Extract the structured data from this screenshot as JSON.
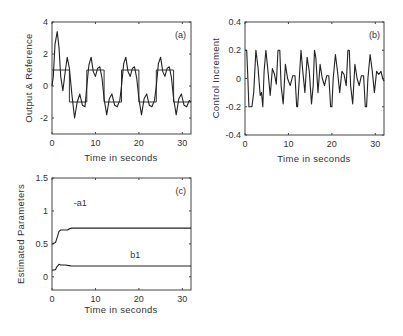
{
  "chart_data": [
    {
      "id": "a",
      "type": "line",
      "panel_label": "(a)",
      "xlabel": "Time in seconds",
      "ylabel": "Output & Reference",
      "xlim": [
        0,
        32
      ],
      "ylim": [
        -3,
        4
      ],
      "xticks": [
        0,
        10,
        20,
        30
      ],
      "yticks": [
        -2,
        0,
        2,
        4
      ],
      "series": [
        {
          "name": "Reference",
          "style": "step",
          "x": [
            0,
            4,
            4,
            8,
            8,
            12,
            12,
            16,
            16,
            20,
            20,
            24,
            24,
            28,
            28,
            32
          ],
          "y": [
            1,
            1,
            -1,
            -1,
            1,
            1,
            -1,
            -1,
            1,
            1,
            -1,
            -1,
            1,
            1,
            -1,
            -1
          ]
        },
        {
          "name": "Output",
          "x": [
            0,
            0.3,
            0.7,
            1.2,
            1.6,
            2.0,
            2.5,
            3.0,
            3.5,
            4.0,
            4.6,
            5.2,
            5.8,
            6.4,
            7.0,
            7.6,
            8.0,
            8.5,
            9.0,
            9.5,
            10.0,
            10.5,
            11.0,
            11.5,
            12.0,
            12.6,
            13.2,
            13.8,
            14.4,
            15.0,
            15.6,
            16.0,
            16.5,
            17.0,
            17.5,
            18.0,
            18.5,
            19.0,
            19.5,
            20.0,
            20.6,
            21.2,
            21.8,
            22.4,
            23.0,
            23.6,
            24.0,
            24.5,
            25.0,
            25.5,
            26.0,
            26.5,
            27.0,
            27.5,
            28.0,
            28.6,
            29.2,
            29.8,
            30.4,
            31.0,
            31.6,
            32.0
          ],
          "y": [
            0,
            0.6,
            2.6,
            3.4,
            2.4,
            0.6,
            -0.3,
            0.8,
            1.8,
            1.1,
            -0.6,
            -2.0,
            -1.0,
            -0.5,
            -1.2,
            -1.3,
            0.0,
            1.3,
            1.8,
            0.9,
            0.6,
            1.1,
            1.2,
            0.5,
            -0.8,
            -1.8,
            -0.8,
            -0.5,
            -1.2,
            -1.3,
            -0.9,
            0.0,
            1.4,
            1.8,
            0.9,
            0.6,
            1.1,
            1.2,
            0.5,
            -0.8,
            -1.8,
            -0.8,
            -0.5,
            -1.2,
            -1.3,
            -0.9,
            0.0,
            1.4,
            1.8,
            0.9,
            0.6,
            1.1,
            1.2,
            0.5,
            -0.8,
            -1.8,
            -0.8,
            -0.5,
            -1.2,
            -1.3,
            -0.9,
            -1.0
          ]
        }
      ]
    },
    {
      "id": "b",
      "type": "line",
      "panel_label": "(b)",
      "xlabel": "Time in seconds",
      "ylabel": "Control Increment",
      "xlim": [
        0,
        32
      ],
      "ylim": [
        -0.4,
        0.4
      ],
      "xticks": [
        0,
        10,
        20,
        30
      ],
      "yticks": [
        -0.4,
        -0.2,
        0,
        0.2,
        0.4
      ],
      "series": [
        {
          "name": "Control Increment",
          "x": [
            0,
            0.4,
            0.6,
            0.9,
            1.6,
            2.0,
            2.5,
            3.0,
            3.5,
            3.8,
            4.1,
            4.4,
            4.8,
            5.3,
            5.8,
            6.3,
            6.8,
            7.2,
            7.6,
            8.0,
            8.3,
            8.8,
            9.3,
            9.8,
            10.4,
            11.0,
            11.5,
            11.9,
            12.1,
            12.5,
            12.9,
            13.3,
            13.8,
            14.3,
            14.8,
            15.3,
            15.7,
            16.0,
            16.3,
            16.8,
            17.3,
            17.8,
            18.3,
            18.8,
            19.3,
            19.7,
            20.0,
            20.3,
            20.8,
            21.3,
            21.8,
            22.3,
            22.8,
            23.3,
            23.7,
            24.0,
            24.3,
            24.8,
            25.3,
            25.8,
            26.3,
            26.8,
            27.3,
            27.7,
            28.0,
            28.3,
            28.8,
            29.3,
            29.8,
            30.3,
            30.8,
            31.3,
            31.7,
            32.0
          ],
          "y": [
            0.2,
            0.2,
            0.05,
            -0.2,
            -0.2,
            -0.1,
            0.2,
            0.08,
            -0.12,
            -0.1,
            -0.2,
            0.05,
            0.2,
            0.05,
            -0.12,
            0.07,
            0.03,
            -0.04,
            0.2,
            0.2,
            -0.05,
            -0.18,
            0.1,
            0.0,
            -0.05,
            0.02,
            0.02,
            -0.2,
            -0.2,
            0.0,
            0.2,
            0.05,
            -0.1,
            0.15,
            0.05,
            -0.18,
            -0.05,
            0.2,
            0.15,
            -0.1,
            0.1,
            0.0,
            -0.05,
            0.02,
            0.02,
            -0.2,
            -0.2,
            0.0,
            0.17,
            0.05,
            -0.1,
            0.05,
            0.03,
            -0.05,
            0.2,
            0.2,
            -0.05,
            -0.18,
            0.1,
            0.0,
            -0.05,
            0.02,
            0.02,
            -0.2,
            -0.2,
            0.0,
            0.17,
            0.05,
            -0.1,
            0.05,
            0.03,
            0.05,
            0.0,
            -0.02
          ]
        }
      ]
    },
    {
      "id": "c",
      "type": "line",
      "panel_label": "(c)",
      "xlabel": "Time in seconds",
      "ylabel": "Estimated Parameters",
      "xlim": [
        0,
        32
      ],
      "ylim": [
        -0.2,
        1.5
      ],
      "xticks": [
        0,
        10,
        20,
        30
      ],
      "yticks": [
        0,
        0.5,
        1,
        1.5
      ],
      "annotations": [
        {
          "text": "-a1",
          "x": 5,
          "y": 1.08
        },
        {
          "text": "b1",
          "x": 18,
          "y": 0.28
        }
      ],
      "series": [
        {
          "name": "-a1",
          "x": [
            0,
            0.8,
            1.2,
            1.6,
            2.0,
            2.5,
            3.0,
            3.6,
            4.0,
            4.5,
            8,
            16,
            24,
            32
          ],
          "y": [
            0.5,
            0.52,
            0.6,
            0.69,
            0.71,
            0.71,
            0.71,
            0.71,
            0.73,
            0.74,
            0.74,
            0.74,
            0.74,
            0.74
          ]
        },
        {
          "name": "b1",
          "x": [
            0,
            0.8,
            1.2,
            1.6,
            2.0,
            3.0,
            4.0,
            4.5,
            8,
            16,
            24,
            32
          ],
          "y": [
            0.1,
            0.11,
            0.16,
            0.19,
            0.18,
            0.18,
            0.17,
            0.165,
            0.165,
            0.165,
            0.165,
            0.165
          ]
        }
      ]
    }
  ]
}
